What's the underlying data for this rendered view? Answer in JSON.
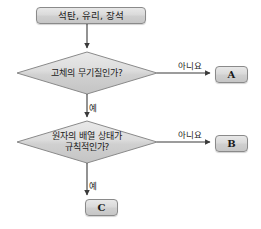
{
  "diagram": {
    "type": "flowchart",
    "start": {
      "label": "석탄, 유리, 장석"
    },
    "decisions": [
      {
        "id": "decision-1",
        "line1": "고체의 무기질인가?",
        "line2": "",
        "yes_label": "예",
        "no_label": "아니요",
        "no_target": "A",
        "yes_target": "decision-2"
      },
      {
        "id": "decision-2",
        "line1": "원자의 배열 상태가",
        "line2": "규칙적인가?",
        "yes_label": "예",
        "no_label": "아니요",
        "no_target": "B",
        "yes_target": "C"
      }
    ],
    "results": [
      {
        "id": "result-a",
        "label": "A"
      },
      {
        "id": "result-b",
        "label": "B"
      },
      {
        "id": "result-c",
        "label": "C"
      }
    ],
    "colors": {
      "shape_fill_light": "#e8e8e8",
      "shape_fill_dark": "#c6c6c6",
      "shape_border": "#8a8a8a",
      "connector": "#3a3a3a",
      "text": "#1a1a1a",
      "background": "#ffffff"
    }
  }
}
